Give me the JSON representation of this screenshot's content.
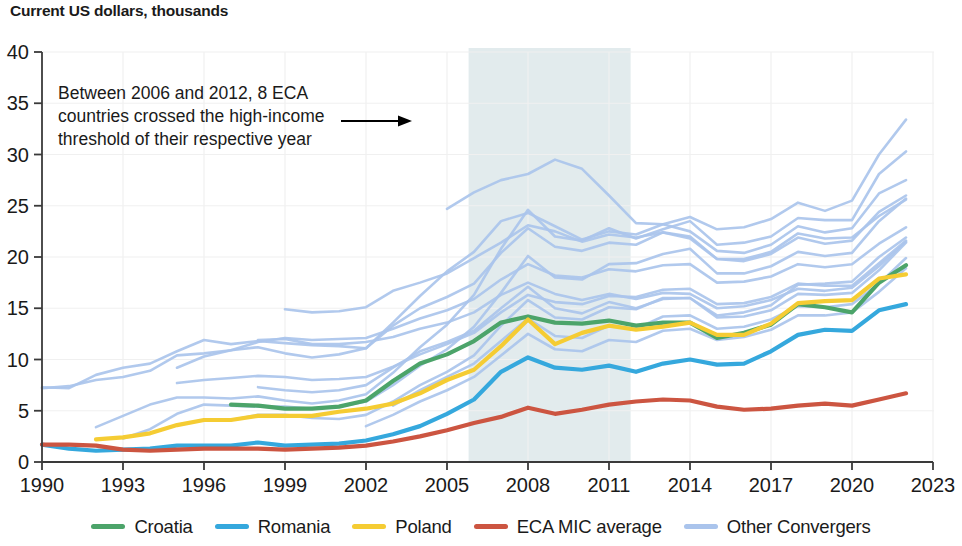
{
  "header": {
    "title": "Current US dollars, thousands"
  },
  "annotation": {
    "lines": [
      "Between 2006 and 2012, 8 ECA",
      "countries crossed the high-income",
      "threshold of their respective year"
    ],
    "arrow_icon": "arrow-right-icon"
  },
  "legend": {
    "items": [
      {
        "label": "Croatia",
        "color": "#4ca46a"
      },
      {
        "label": "Romania",
        "color": "#35a8dd"
      },
      {
        "label": "Poland",
        "color": "#f5cc33"
      },
      {
        "label": "ECA MIC average",
        "color": "#cc5541"
      },
      {
        "label": "Other Convergers",
        "color": "#aac4ec"
      }
    ]
  },
  "chart_data": {
    "type": "line",
    "title": "Current US dollars, thousands",
    "xlabel": "",
    "ylabel": "Current US dollars, thousands",
    "xlim": [
      1990,
      2023
    ],
    "ylim": [
      0,
      40
    ],
    "xticks": [
      1990,
      1993,
      1996,
      1999,
      2002,
      2005,
      2008,
      2011,
      2014,
      2017,
      2020,
      2023
    ],
    "yticks": [
      0,
      5,
      10,
      15,
      20,
      25,
      30,
      35,
      40
    ],
    "grid": true,
    "legend_position": "bottom",
    "highlight_band": {
      "label": "2006-2012",
      "x0": 2005.8,
      "x1": 2011.8,
      "color": "#e2ebed"
    },
    "series": [
      {
        "name": "Croatia",
        "color": "#4ca46a",
        "width": 4.2,
        "x": [
          1997,
          1998,
          1999,
          2000,
          2001,
          2002,
          2003,
          2004,
          2005,
          2006,
          2007,
          2008,
          2009,
          2010,
          2011,
          2012,
          2013,
          2014,
          2015,
          2016,
          2017,
          2018,
          2019,
          2020,
          2021,
          2022
        ],
        "values": [
          5.6,
          5.5,
          5.2,
          5.2,
          5.4,
          6.0,
          7.9,
          9.6,
          10.5,
          11.8,
          13.6,
          14.2,
          13.6,
          13.5,
          13.8,
          13.3,
          13.6,
          13.6,
          12.1,
          12.6,
          13.4,
          15.4,
          15.1,
          14.6,
          17.5,
          19.2
        ]
      },
      {
        "name": "Romania",
        "color": "#35a8dd",
        "width": 4.2,
        "x": [
          1990,
          1991,
          1992,
          1993,
          1994,
          1995,
          1996,
          1997,
          1998,
          1999,
          2000,
          2001,
          2002,
          2003,
          2004,
          2005,
          2006,
          2007,
          2008,
          2009,
          2010,
          2011,
          2012,
          2013,
          2014,
          2015,
          2016,
          2017,
          2018,
          2019,
          2020,
          2021,
          2022
        ],
        "values": [
          1.7,
          1.3,
          1.1,
          1.2,
          1.3,
          1.6,
          1.6,
          1.6,
          1.9,
          1.6,
          1.7,
          1.8,
          2.1,
          2.7,
          3.5,
          4.7,
          6.1,
          8.8,
          10.2,
          9.2,
          9.0,
          9.4,
          8.8,
          9.6,
          10.0,
          9.5,
          9.6,
          10.8,
          12.4,
          12.9,
          12.8,
          14.8,
          15.4
        ]
      },
      {
        "name": "Poland",
        "color": "#f5cc33",
        "width": 4.2,
        "x": [
          1992,
          1993,
          1994,
          1995,
          1996,
          1997,
          1998,
          1999,
          2000,
          2001,
          2002,
          2003,
          2004,
          2005,
          2006,
          2007,
          2008,
          2009,
          2010,
          2011,
          2012,
          2013,
          2014,
          2015,
          2016,
          2017,
          2018,
          2019,
          2020,
          2021,
          2022
        ],
        "values": [
          2.2,
          2.4,
          2.8,
          3.6,
          4.1,
          4.1,
          4.5,
          4.5,
          4.5,
          4.9,
          5.2,
          5.7,
          6.7,
          8.0,
          9.0,
          11.3,
          13.9,
          11.5,
          12.6,
          13.3,
          12.9,
          13.2,
          13.6,
          12.4,
          12.4,
          13.5,
          15.5,
          15.7,
          15.8,
          17.9,
          18.3
        ]
      },
      {
        "name": "ECA MIC average",
        "color": "#cc5541",
        "width": 4.2,
        "x": [
          1990,
          1991,
          1992,
          1993,
          1994,
          1995,
          1996,
          1997,
          1998,
          1999,
          2000,
          2001,
          2002,
          2003,
          2004,
          2005,
          2006,
          2007,
          2008,
          2009,
          2010,
          2011,
          2012,
          2013,
          2014,
          2015,
          2016,
          2017,
          2018,
          2019,
          2020,
          2021,
          2022
        ],
        "values": [
          1.7,
          1.7,
          1.6,
          1.2,
          1.1,
          1.2,
          1.3,
          1.3,
          1.3,
          1.2,
          1.3,
          1.4,
          1.6,
          2.0,
          2.5,
          3.1,
          3.8,
          4.4,
          5.3,
          4.7,
          5.1,
          5.6,
          5.9,
          6.1,
          6.0,
          5.4,
          5.1,
          5.2,
          5.5,
          5.7,
          5.5,
          6.1,
          6.7
        ]
      }
    ],
    "other_convergers": {
      "name": "Other Convergers",
      "color": "#aac4ec",
      "width": 2.6,
      "count": 13,
      "lines": [
        {
          "x": [
            1990,
            1991,
            1992,
            1993,
            1994,
            1995,
            1996,
            1997,
            1998,
            1999,
            2000,
            2001,
            2002,
            2003,
            2004,
            2005,
            2006,
            2007,
            2008,
            2009,
            2010,
            2011,
            2012,
            2013,
            2014,
            2015,
            2016,
            2017,
            2018,
            2019,
            2020,
            2021,
            2022
          ],
          "values": [
            7.3,
            7.2,
            8.5,
            9.2,
            9.6,
            10.8,
            11.9,
            11.5,
            11.8,
            11.6,
            11.4,
            11.3,
            11.1,
            13.6,
            16.2,
            18.6,
            20.5,
            23.5,
            24.3,
            23.0,
            21.7,
            22.5,
            22.2,
            23.2,
            22.5,
            20.6,
            20.4,
            21.2,
            23.0,
            22.4,
            22.8,
            26.2,
            27.5
          ]
        },
        {
          "x": [
            1992,
            1993,
            1994,
            1995,
            1996,
            1997,
            1998,
            1999,
            2000,
            2001,
            2002,
            2003,
            2004,
            2005,
            2006,
            2007,
            2008,
            2009,
            2010,
            2011,
            2012,
            2013,
            2014,
            2015,
            2016,
            2017,
            2018,
            2019,
            2020,
            2021,
            2022
          ],
          "values": [
            3.4,
            4.5,
            5.6,
            6.3,
            6.3,
            6.2,
            6.4,
            6.0,
            5.7,
            6.0,
            6.6,
            8.7,
            11.2,
            13.4,
            16.3,
            20.8,
            24.6,
            22.0,
            21.6,
            22.8,
            21.8,
            22.7,
            23.5,
            21.2,
            21.4,
            22.0,
            23.8,
            23.6,
            23.6,
            28.1,
            30.3
          ]
        },
        {
          "x": [
            2005,
            2006,
            2007,
            2008,
            2009,
            2010,
            2011,
            2012,
            2013,
            2014,
            2015,
            2016,
            2017,
            2018,
            2019,
            2020,
            2021,
            2022
          ],
          "values": [
            24.7,
            26.3,
            27.5,
            28.1,
            29.5,
            28.6,
            26.0,
            23.3,
            23.2,
            23.9,
            22.7,
            22.9,
            23.7,
            25.3,
            24.5,
            25.5,
            30.0,
            33.4
          ]
        },
        {
          "x": [
            1993,
            1994,
            1995,
            1996,
            1997,
            1998,
            1999,
            2000,
            2001,
            2002,
            2003,
            2004,
            2005,
            2006,
            2007,
            2008,
            2009,
            2010,
            2011,
            2012,
            2013,
            2014,
            2015,
            2016,
            2017,
            2018,
            2019,
            2020,
            2021,
            2022
          ],
          "values": [
            2.3,
            3.2,
            4.7,
            5.6,
            5.5,
            5.4,
            5.4,
            5.2,
            5.4,
            5.9,
            7.5,
            9.4,
            11.0,
            13.2,
            16.5,
            20.1,
            18.0,
            17.8,
            19.3,
            19.4,
            20.3,
            20.8,
            18.4,
            18.4,
            19.1,
            20.5,
            20.1,
            20.4,
            23.5,
            25.7
          ]
        },
        {
          "x": [
            1990,
            1991,
            1992,
            1993,
            1994,
            1995,
            1996,
            1997,
            1998,
            1999,
            2000,
            2001,
            2002,
            2003,
            2004,
            2005,
            2006,
            2007,
            2008,
            2009,
            2010,
            2011,
            2012,
            2013,
            2014,
            2015,
            2016,
            2017,
            2018,
            2019,
            2020,
            2021,
            2022
          ],
          "values": [
            7.2,
            7.4,
            8.0,
            8.3,
            8.9,
            10.4,
            10.6,
            10.9,
            11.2,
            10.6,
            10.2,
            10.5,
            11.1,
            13.3,
            15.0,
            16.1,
            17.4,
            20.4,
            22.8,
            21.0,
            20.6,
            21.4,
            21.2,
            22.4,
            22.0,
            19.8,
            19.6,
            20.3,
            21.9,
            21.3,
            21.6,
            24.4,
            26.0
          ]
        },
        {
          "x": [
            1999,
            2000,
            2001,
            2002,
            2003,
            2004,
            2005,
            2006,
            2007,
            2008,
            2009,
            2010,
            2011,
            2012,
            2013,
            2014,
            2015,
            2016,
            2017,
            2018,
            2019,
            2020,
            2021,
            2022
          ],
          "values": [
            14.9,
            14.6,
            14.7,
            15.1,
            16.7,
            17.5,
            18.4,
            19.9,
            21.4,
            23.1,
            22.5,
            21.5,
            22.2,
            21.9,
            22.4,
            21.8,
            19.8,
            19.8,
            20.5,
            22.3,
            21.8,
            21.9,
            24.0,
            25.6
          ]
        },
        {
          "x": [
            1995,
            1996,
            1997,
            1998,
            1999,
            2000,
            2001,
            2002,
            2003,
            2004,
            2005,
            2006,
            2007,
            2008,
            2009,
            2010,
            2011,
            2012,
            2013,
            2014,
            2015,
            2016,
            2017,
            2018,
            2019,
            2020,
            2021,
            2022
          ],
          "values": [
            9.2,
            10.3,
            10.9,
            11.7,
            12.1,
            11.9,
            12.0,
            12.1,
            13.0,
            14.0,
            14.8,
            15.9,
            17.8,
            19.3,
            18.2,
            18.0,
            18.8,
            18.6,
            19.2,
            19.3,
            17.5,
            17.6,
            18.1,
            19.3,
            19.0,
            19.3,
            21.3,
            22.9
          ]
        },
        {
          "x": [
            1995,
            1996,
            1997,
            1998,
            1999,
            2000,
            2001,
            2002,
            2003,
            2004,
            2005,
            2006,
            2007,
            2008,
            2009,
            2010,
            2011,
            2012,
            2013,
            2014,
            2015,
            2016,
            2017,
            2018,
            2019,
            2020,
            2021,
            2022
          ],
          "values": [
            7.7,
            8.0,
            8.2,
            8.4,
            8.3,
            8.0,
            8.1,
            8.3,
            9.3,
            10.5,
            11.5,
            12.6,
            14.6,
            16.3,
            15.6,
            15.4,
            16.2,
            16.1,
            16.8,
            16.9,
            15.4,
            15.5,
            16.1,
            17.4,
            17.2,
            17.2,
            19.4,
            21.6
          ]
        },
        {
          "x": [
            1998,
            1999,
            2000,
            2001,
            2002,
            2003,
            2004,
            2005,
            2006,
            2007,
            2008,
            2009,
            2010,
            2011,
            2012,
            2013,
            2014,
            2015,
            2016,
            2017,
            2018,
            2019,
            2020,
            2021,
            2022
          ],
          "values": [
            11.9,
            12.0,
            11.5,
            11.5,
            11.7,
            12.2,
            13.0,
            13.6,
            14.6,
            16.3,
            17.5,
            16.4,
            15.8,
            16.4,
            15.9,
            16.5,
            16.4,
            15.0,
            15.2,
            15.8,
            16.9,
            16.7,
            17.0,
            19.1,
            21.5
          ]
        },
        {
          "x": [
            1994,
            1995,
            1996,
            1997,
            1998,
            1999,
            2000,
            2001,
            2002,
            2003,
            2004,
            2005,
            2006,
            2007,
            2008,
            2009,
            2010,
            2011,
            2012,
            2013,
            2014,
            2015,
            2016,
            2017,
            2018,
            2019,
            2020,
            2021,
            2022
          ],
          "values": [
            2.8,
            3.6,
            4.1,
            4.1,
            4.6,
            4.6,
            4.3,
            4.2,
            4.6,
            5.9,
            7.5,
            8.8,
            10.4,
            13.3,
            15.8,
            14.1,
            13.9,
            15.1,
            14.9,
            16.0,
            16.0,
            14.3,
            14.6,
            15.3,
            17.3,
            17.4,
            17.6,
            20.0,
            21.9
          ]
        },
        {
          "x": [
            1998,
            1999,
            2000,
            2001,
            2002,
            2003,
            2004,
            2005,
            2006,
            2007,
            2008,
            2009,
            2010,
            2011,
            2012,
            2013,
            2014,
            2015,
            2016,
            2017,
            2018,
            2019,
            2020,
            2021,
            2022
          ],
          "values": [
            7.3,
            7.0,
            6.8,
            7.0,
            7.5,
            9.2,
            10.8,
            11.7,
            12.8,
            15.0,
            17.1,
            15.0,
            14.5,
            15.6,
            15.0,
            15.9,
            16.0,
            14.1,
            14.2,
            14.8,
            16.4,
            16.3,
            16.5,
            18.7,
            21.4
          ]
        },
        {
          "x": [
            2003,
            2004,
            2005,
            2006,
            2007,
            2008,
            2009,
            2010,
            2011,
            2012,
            2013,
            2014,
            2015,
            2016,
            2017,
            2018,
            2019,
            2020,
            2021,
            2022
          ],
          "values": [
            5.5,
            7.0,
            8.3,
            9.6,
            11.8,
            14.0,
            12.3,
            12.1,
            13.3,
            13.0,
            14.2,
            14.3,
            13.0,
            13.2,
            13.9,
            15.2,
            15.1,
            15.4,
            17.4,
            19.9
          ]
        },
        {
          "x": [
            2002,
            2003,
            2004,
            2005,
            2006,
            2007,
            2008,
            2009,
            2010,
            2011,
            2012,
            2013,
            2014,
            2015,
            2016,
            2017,
            2018,
            2019,
            2020,
            2021,
            2022
          ],
          "values": [
            3.5,
            4.6,
            5.9,
            7.0,
            8.3,
            10.4,
            12.5,
            11.0,
            10.8,
            11.9,
            11.7,
            12.8,
            13.0,
            11.9,
            12.2,
            12.9,
            14.3,
            14.3,
            14.6,
            16.6,
            18.9
          ]
        }
      ]
    }
  }
}
